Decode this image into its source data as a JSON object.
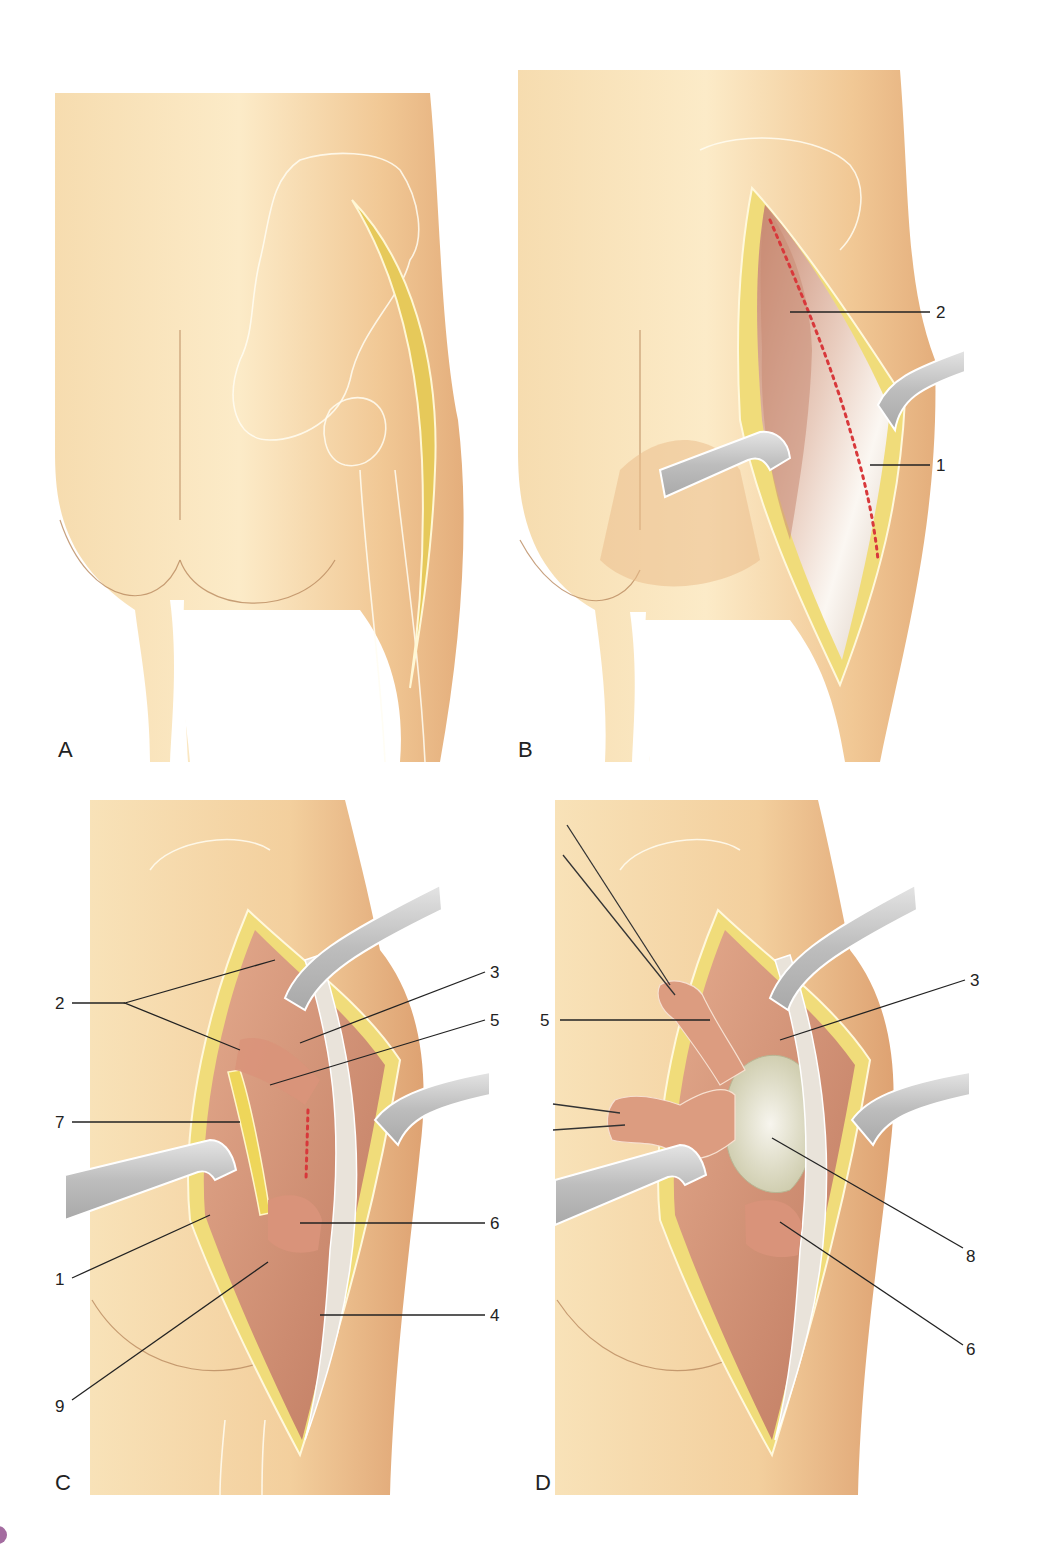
{
  "figure": {
    "colors": {
      "skin_light": "#fbe6bf",
      "skin_mid": "#f2cc98",
      "skin_dark": "#e0a877",
      "fat": "#f0dc7a",
      "muscle": "#d79a7c",
      "muscle_dark": "#b86e55",
      "fascia": "#ece6dc",
      "retractor": "#c9c9c9",
      "incision_dots": "#d8383b",
      "nerve": "#ecd64e",
      "capsule": "#dcdcbf",
      "leader": "#222222",
      "marker_circle": "#a46ca0"
    },
    "panels": [
      {
        "id": "A",
        "letter": "A",
        "caption_role": "skin incision outline",
        "callouts": []
      },
      {
        "id": "B",
        "letter": "B",
        "caption_role": "fascia exposed, retractors placed",
        "callouts": [
          {
            "num": "2",
            "side": "right"
          },
          {
            "num": "1",
            "side": "right"
          }
        ]
      },
      {
        "id": "C",
        "letter": "C",
        "caption_role": "deep dissection, short external rotators",
        "callouts": [
          {
            "num": "2",
            "side": "left"
          },
          {
            "num": "7",
            "side": "left"
          },
          {
            "num": "1",
            "side": "left"
          },
          {
            "num": "9",
            "side": "left"
          },
          {
            "num": "3",
            "side": "right"
          },
          {
            "num": "5",
            "side": "right"
          },
          {
            "num": "6",
            "side": "right"
          },
          {
            "num": "4",
            "side": "right"
          }
        ]
      },
      {
        "id": "D",
        "letter": "D",
        "caption_role": "rotators tagged and reflected, capsule exposed",
        "callouts": [
          {
            "num": "5",
            "side": "left"
          },
          {
            "num": "3",
            "side": "right"
          },
          {
            "num": "8",
            "side": "right"
          },
          {
            "num": "6",
            "side": "right"
          }
        ]
      }
    ],
    "page_marker": {
      "shape": "circle",
      "color": "#a46ca0"
    }
  }
}
